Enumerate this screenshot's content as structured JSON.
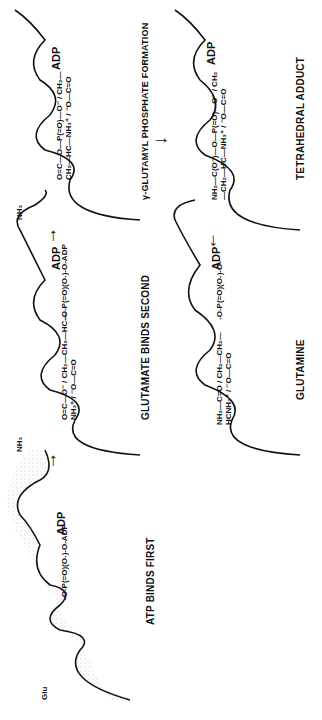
{
  "figure": {
    "orientation": "rotated 90 degrees counter-clockwise",
    "panels": [
      {
        "id": "panel-1",
        "caption": "ATP BINDS FIRST",
        "site_label_left": "Glu",
        "ligand": "-O-P(=O)(O-)-O-ADP",
        "ligand_lines": [
          "O",
          "‖",
          "⁻O—P—O—ADP",
          "|",
          "O⁻"
        ],
        "adp_label": "ADP"
      },
      {
        "id": "panel-2",
        "caption": "GLUTAMATE BINDS SECOND",
        "site_label_left": "NH₃",
        "ligand_atp": "-O-P(=O)(O-)-O-ADP",
        "ligand_glu_lines": [
          "O=C—O⁻",
          "CH₂",
          "CH₂",
          "HC—NH₃⁺",
          "⁻O—C=O"
        ],
        "adp_label": "ADP"
      },
      {
        "id": "panel-3",
        "caption": "γ-GLUTAMYL PHOSPHATE FORMATION",
        "site_label_left": "NH₃",
        "ligand_lines": [
          "O=C—O—P(=O)—O⁻",
          "CH₂",
          "CH₂",
          "HC—NH₃⁺",
          "⁻O—C=O"
        ],
        "adp_label": "ADP"
      },
      {
        "id": "panel-4",
        "caption": "TETRAHEDRAL ADDUCT",
        "ligand_lines": [
          "NH₂—C(O⁻)—O—P(=O)—O⁻",
          "CH₂",
          "CH₂",
          "HC—NH₃⁺",
          "⁻O—C=O"
        ],
        "adp_label": "ADP"
      },
      {
        "id": "panel-5",
        "caption": "GLUTAMINE",
        "ligand_phosphate": "-O-P(=O)(O-)-O-",
        "ligand_lines": [
          "NH₂—C=O",
          "CH₂",
          "CH₂",
          "HCNH₃⁺",
          "⁻O—C=O"
        ],
        "adp_label": "ADP"
      }
    ],
    "arrows": [
      {
        "from": "panel-1",
        "to": "panel-2",
        "glyph": "→"
      },
      {
        "from": "panel-2",
        "to": "panel-3",
        "glyph": "→"
      },
      {
        "from": "panel-3",
        "to": "panel-4",
        "glyph": "↓"
      },
      {
        "from": "panel-4",
        "to": "panel-5",
        "glyph": "←"
      }
    ],
    "texts": {
      "p1_caption": "ATP BINDS FIRST",
      "p2_caption": "GLUTAMATE BINDS SECOND",
      "p3_caption": "γ-GLUTAMYL PHOSPHATE FORMATION",
      "p4_caption": "TETRAHEDRAL ADDUCT",
      "p5_caption": "GLUTAMINE",
      "adp": "ADP",
      "glu": "Glu",
      "nh3": "NH₃",
      "arrow_right": "→",
      "arrow_down": "↓",
      "arrow_left": "←"
    }
  }
}
